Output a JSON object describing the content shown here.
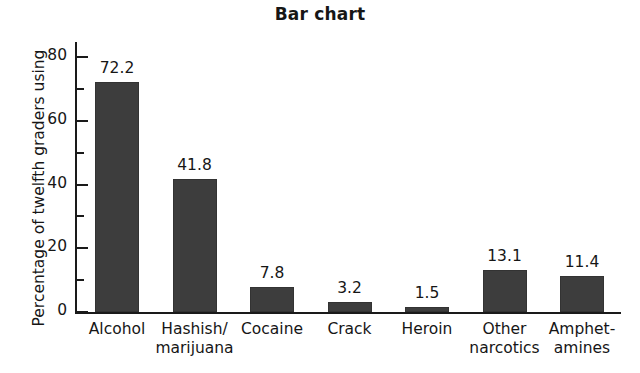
{
  "chart_data": {
    "type": "bar",
    "title": "Bar chart",
    "xlabel": "",
    "ylabel": "Percentage of twelfth graders using",
    "categories": [
      "Alcohol",
      "Hashish/\nmarijuana",
      "Cocaine",
      "Crack",
      "Heroin",
      "Other\nnarcotics",
      "Amphet-\namines"
    ],
    "values": [
      72.2,
      41.8,
      7.8,
      3.2,
      1.5,
      13.1,
      11.4
    ],
    "value_labels": [
      "72.2",
      "41.8",
      "7.8",
      "3.2",
      "1.5",
      "13.1",
      "11.4"
    ],
    "ylim": [
      0,
      85
    ],
    "y_ticks": [
      0,
      20,
      40,
      60,
      80
    ],
    "y_tick_labels": [
      "0",
      "20",
      "40",
      "60",
      "80"
    ],
    "y_minor_ticks": [
      10,
      30,
      50,
      70
    ],
    "grid": false,
    "legend": null,
    "bar_color": "#3d3d3d",
    "axis_color": "#1a1a1a",
    "background_color": "#ffffff"
  }
}
